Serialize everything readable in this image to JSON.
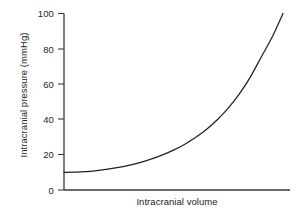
{
  "chart_data": {
    "type": "line",
    "title": "",
    "subtitle": "",
    "xlabel": "Intracranial volume",
    "ylabel": "Intracranial pressure (mmHg)",
    "xlim": [
      0,
      100
    ],
    "ylim": [
      0,
      100
    ],
    "grid": false,
    "legend": null,
    "x_tick_labels": [],
    "y_tick_labels": [
      "0",
      "20",
      "40",
      "60",
      "80",
      "100"
    ],
    "y_ticks": [
      0,
      20,
      40,
      60,
      80,
      100
    ],
    "annotations": [],
    "series": [
      {
        "name": "Intracranial pressure-volume curve",
        "color": "#231f20",
        "x": [
          0,
          5,
          10,
          15,
          20,
          25,
          30,
          35,
          40,
          45,
          50,
          55,
          60,
          65,
          70,
          75,
          80,
          85,
          90,
          95,
          100
        ],
        "y": [
          10,
          10.1,
          10.4,
          11.0,
          11.8,
          12.8,
          14.1,
          15.7,
          17.6,
          19.9,
          22.6,
          25.8,
          29.7,
          34.3,
          39.8,
          46.4,
          54.3,
          63.8,
          75.2,
          86.5,
          100
        ]
      }
    ]
  },
  "axis": {
    "line_color": "#3a3a3a",
    "tick_color": "#3a3a3a"
  }
}
